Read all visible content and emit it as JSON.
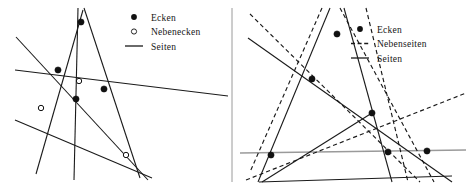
{
  "figure": {
    "type": "geometry-diagram",
    "background_color": "#ffffff",
    "width": 467,
    "height": 188,
    "divider": {
      "name": "panel-divider",
      "orientation": "vertical",
      "x": 232,
      "y1": 8,
      "y2": 182,
      "color": "#9a9a9a",
      "width": 1
    },
    "colors": {
      "line_solid": "#1a1a1a",
      "line_dashed": "#1a1a1a",
      "line_gray": "#9a9a9a",
      "vertex_fill": "#111111",
      "vertex_open_fill": "#ffffff",
      "text": "#161616"
    }
  },
  "left_panel": {
    "name": "left-diagram",
    "legend": {
      "name": "left-legend",
      "items": [
        {
          "label": "Ecken",
          "symbol": "filled-dot",
          "icon_name": "filled-dot-icon"
        },
        {
          "label": "Nebenecken",
          "symbol": "open-dot",
          "icon_name": "open-dot-icon"
        },
        {
          "label": "Seiten",
          "symbol": "solid-line",
          "icon_name": "solid-line-icon"
        }
      ]
    },
    "lines": [
      {
        "name": "seite-1",
        "style": "solid",
        "x1": 16,
        "y1": 37,
        "x2": 148,
        "y2": 180
      },
      {
        "name": "seite-2",
        "style": "solid",
        "x1": 15,
        "y1": 70,
        "x2": 228,
        "y2": 96
      },
      {
        "name": "seite-3",
        "style": "solid",
        "x1": 15,
        "y1": 120,
        "x2": 152,
        "y2": 178
      },
      {
        "name": "seite-4",
        "style": "solid",
        "x1": 78,
        "y1": 8,
        "x2": 74,
        "y2": 180
      },
      {
        "name": "seite-5",
        "style": "solid",
        "x1": 84,
        "y1": 8,
        "x2": 140,
        "y2": 178
      },
      {
        "name": "seite-6",
        "style": "solid",
        "x1": 36,
        "y1": 174,
        "x2": 83,
        "y2": 10
      }
    ],
    "vertices": [
      {
        "name": "ecke-top",
        "type": "filled",
        "x": 81,
        "y": 22
      },
      {
        "name": "ecke-left",
        "type": "filled",
        "x": 58,
        "y": 70
      },
      {
        "name": "ecke-center",
        "type": "filled",
        "x": 76,
        "y": 99
      },
      {
        "name": "ecke-right",
        "type": "filled",
        "x": 104,
        "y": 89
      },
      {
        "name": "nebenecke-mid",
        "type": "open",
        "x": 79,
        "y": 81
      },
      {
        "name": "nebenecke-lower-left",
        "type": "open",
        "x": 41,
        "y": 108
      },
      {
        "name": "nebenecke-lower-right",
        "type": "open",
        "x": 126,
        "y": 155
      }
    ]
  },
  "right_panel": {
    "name": "right-diagram",
    "legend": {
      "name": "right-legend",
      "items": [
        {
          "label": "Ecken",
          "symbol": "filled-dot",
          "icon_name": "filled-dot-icon"
        },
        {
          "label": "Nebenseiten",
          "symbol": "dashed-line",
          "icon_name": "dashed-line-icon"
        },
        {
          "label": "Seiten",
          "symbol": "solid-line",
          "icon_name": "solid-line-icon"
        }
      ]
    },
    "lines": [
      {
        "name": "seite-a",
        "style": "solid",
        "x1": 248,
        "y1": 38,
        "x2": 452,
        "y2": 182
      },
      {
        "name": "seite-b",
        "style": "solid",
        "x1": 330,
        "y1": 8,
        "x2": 258,
        "y2": 182
      },
      {
        "name": "seite-c",
        "style": "solid",
        "x1": 344,
        "y1": 8,
        "x2": 392,
        "y2": 182
      },
      {
        "name": "seite-d",
        "style": "solid",
        "x1": 259,
        "y1": 182,
        "x2": 452,
        "y2": 176
      },
      {
        "name": "seite-e",
        "style": "solid",
        "x1": 372,
        "y1": 113,
        "x2": 262,
        "y2": 182
      },
      {
        "name": "seite-f",
        "style": "gray-horizontal",
        "x1": 240,
        "y1": 153,
        "x2": 466,
        "y2": 150
      }
    ],
    "dashed_lines": [
      {
        "name": "nebenseite-1",
        "style": "dashed",
        "x1": 250,
        "y1": 14,
        "x2": 420,
        "y2": 182
      },
      {
        "name": "nebenseite-2",
        "style": "dashed",
        "x1": 322,
        "y1": 8,
        "x2": 250,
        "y2": 172
      },
      {
        "name": "nebenseite-3",
        "style": "dashed",
        "x1": 340,
        "y1": 8,
        "x2": 434,
        "y2": 182
      },
      {
        "name": "nebenseite-4",
        "style": "dashed",
        "x1": 246,
        "y1": 180,
        "x2": 466,
        "y2": 93
      },
      {
        "name": "nebenseite-5",
        "style": "dashed",
        "x1": 366,
        "y1": 8,
        "x2": 408,
        "y2": 182
      }
    ],
    "vertices": [
      {
        "name": "ecke-top",
        "type": "filled",
        "x": 337,
        "y": 34
      },
      {
        "name": "ecke-upper-left",
        "type": "filled",
        "x": 312,
        "y": 79
      },
      {
        "name": "ecke-middle-right",
        "type": "filled",
        "x": 372,
        "y": 113
      },
      {
        "name": "ecke-bottom-left",
        "type": "filled",
        "x": 271,
        "y": 155
      },
      {
        "name": "ecke-bottom-mid",
        "type": "filled",
        "x": 388,
        "y": 152
      },
      {
        "name": "ecke-bottom-right",
        "type": "filled",
        "x": 427,
        "y": 151
      }
    ]
  }
}
